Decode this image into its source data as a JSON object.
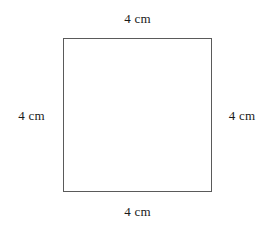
{
  "figure": {
    "shape_name": "square",
    "labels": {
      "top": "4 cm",
      "right": "4 cm",
      "bottom": "4 cm",
      "left": "4 cm"
    },
    "colors": {
      "stroke": "#5a5a5a",
      "fill": "#ffffff",
      "text": "#1a1a1a",
      "background": "#ffffff"
    }
  }
}
